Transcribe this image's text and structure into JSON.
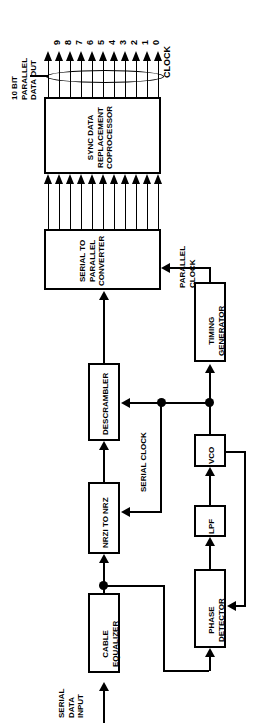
{
  "diagram": {
    "orientation": "rotated-90-ccw",
    "accent_color": "#000000",
    "background_color": "#ffffff"
  },
  "labels": {
    "parallel_data_out": [
      "10 BIT",
      "PARALLEL",
      "DATA OUT"
    ],
    "serial_data_input": [
      "SERIAL",
      "DATA",
      "INPUT"
    ],
    "parallel_clock": [
      "PARALLEL",
      "CLOCK"
    ],
    "serial_clock": "SERIAL CLOCK"
  },
  "bus_ports": {
    "count": 11,
    "names": [
      "9",
      "8",
      "7",
      "6",
      "5",
      "4",
      "3",
      "2",
      "1",
      "0",
      "CLOCK"
    ]
  },
  "blocks": [
    {
      "id": "coprocessor",
      "lines": [
        "SYNC DATA",
        "REPLACEMENT",
        "COPROCESSOR"
      ]
    },
    {
      "id": "serial-to-parallel",
      "lines": [
        "SERIAL TO",
        "PARALLEL",
        "CONVERTER"
      ]
    },
    {
      "id": "timing-generator",
      "lines": [
        "TIMING",
        "GENERATOR"
      ]
    },
    {
      "id": "descrambler",
      "lines": [
        "DESCRAMBLER"
      ]
    },
    {
      "id": "nrzi-to-nrz",
      "lines": [
        "NRZI TO NRZ"
      ]
    },
    {
      "id": "vco",
      "lines": [
        "VCO"
      ]
    },
    {
      "id": "lpf",
      "lines": [
        "LPF"
      ]
    },
    {
      "id": "phase-detector",
      "lines": [
        "PHASE",
        "DETECTOR"
      ]
    },
    {
      "id": "cable-equalizer",
      "lines": [
        "CABLE",
        "EQUALIZER"
      ]
    }
  ]
}
